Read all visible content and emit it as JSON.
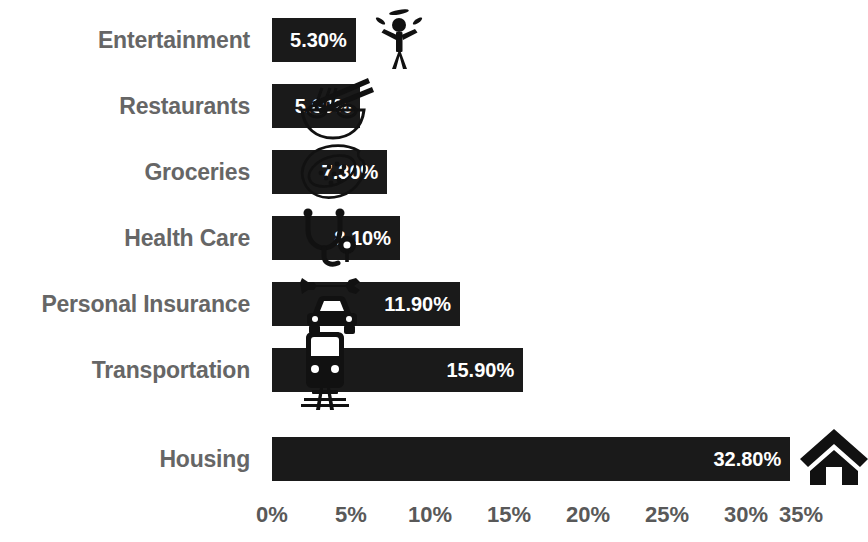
{
  "chart_data": {
    "type": "bar",
    "orientation": "horizontal",
    "title": "",
    "subtitle": "",
    "xlabel": "",
    "ylabel": "",
    "categories": [
      "Entertainment",
      "Restaurants",
      "Groceries",
      "Health Care",
      "Personal Insurance",
      "Transportation",
      "Housing"
    ],
    "values": [
      5.3,
      5.6,
      7.3,
      8.1,
      11.9,
      15.9,
      32.8
    ],
    "value_labels": [
      "5.30%",
      "5.60%",
      "7.30%",
      "8.10%",
      "11.90%",
      "15.90%",
      "32.80%"
    ],
    "icons": [
      "juggler-icon",
      "noodle-bowl-icon",
      "papaya-fruit-icon",
      "stethoscope-icon",
      "car-wrench-icon",
      "train-icon",
      "house-icon"
    ],
    "xlim": [
      0,
      35
    ],
    "xticks": [
      0,
      5,
      10,
      15,
      20,
      25,
      30,
      35
    ],
    "xtick_labels": [
      "0%",
      "5%",
      "10%",
      "15%",
      "20%",
      "25%",
      "30%",
      "35%"
    ],
    "grid": false,
    "legend": null,
    "colors": {
      "bar": "#1a1a1a",
      "bar_value_text": "#ffffff",
      "category_label_text": "#666666",
      "tick_label_text": "#595959",
      "background": "#ffffff",
      "icon": "#111111"
    }
  }
}
